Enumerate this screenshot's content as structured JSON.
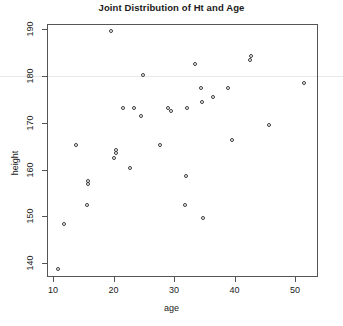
{
  "chart_data": {
    "type": "scatter",
    "title": "Joint Distribution of Ht and Age",
    "xlabel": "age",
    "ylabel": "height",
    "xlim": [
      9.0,
      53.8
    ],
    "ylim": [
      137.1,
      191.0
    ],
    "xticks": [
      10,
      20,
      30,
      40,
      50
    ],
    "xtick_labels": [
      "10",
      "20",
      "30",
      "40",
      "50"
    ],
    "yticks": [
      140,
      150,
      160,
      170,
      180,
      190
    ],
    "ytick_labels": [
      "140",
      "150",
      "160",
      "170",
      "180",
      "190"
    ],
    "grid": false,
    "legend": null,
    "marker": "open-circle",
    "marker_color": "#3a3a3a",
    "frame_color": "#555555",
    "guide_line_y": 180,
    "guide_line_color": "#e9e9e9",
    "n_points": 38,
    "series": [
      {
        "name": "observations",
        "x": [
          11.0,
          11.9,
          13.9,
          15.7,
          15.9,
          16.0,
          19.8,
          20.3,
          20.5,
          20.6,
          21.8,
          22.9,
          24.6,
          24.7,
          25.0,
          27.9,
          29.2,
          29.6,
          31.9,
          32.1,
          32.3,
          33.7,
          34.6,
          34.8,
          34.9,
          35.0,
          36.6,
          39.1,
          39.8,
          42.8,
          42.9,
          45.8,
          51.6
        ],
        "y": [
          138.5,
          148.2,
          165.0,
          152.2,
          156.6,
          157.4,
          189.3,
          162.2,
          163.3,
          164.0,
          172.9,
          160.2,
          172.9,
          180.0,
          171.2,
          165.1,
          172.9,
          172.2,
          152.2,
          158.4,
          172.9,
          182.2,
          177.2,
          174.1,
          149.5,
          174.1,
          175.2,
          177.2,
          166.1,
          183.2,
          184.0,
          169.3,
          178.2
        ]
      }
    ],
    "points": [
      {
        "age": 11.0,
        "height": 138.5
      },
      {
        "age": 11.9,
        "height": 148.2
      },
      {
        "age": 13.9,
        "height": 165.0
      },
      {
        "age": 15.7,
        "height": 152.2
      },
      {
        "age": 15.9,
        "height": 156.6
      },
      {
        "age": 16.0,
        "height": 157.4
      },
      {
        "age": 19.8,
        "height": 189.3
      },
      {
        "age": 20.3,
        "height": 162.2
      },
      {
        "age": 20.6,
        "height": 163.3
      },
      {
        "age": 20.6,
        "height": 164.0
      },
      {
        "age": 21.8,
        "height": 172.9
      },
      {
        "age": 22.9,
        "height": 160.2
      },
      {
        "age": 23.6,
        "height": 172.9
      },
      {
        "age": 24.7,
        "height": 171.2
      },
      {
        "age": 25.0,
        "height": 180.0
      },
      {
        "age": 27.9,
        "height": 165.1
      },
      {
        "age": 29.2,
        "height": 172.9
      },
      {
        "age": 29.6,
        "height": 172.2
      },
      {
        "age": 31.9,
        "height": 152.2
      },
      {
        "age": 32.1,
        "height": 158.4
      },
      {
        "age": 32.3,
        "height": 172.9
      },
      {
        "age": 33.7,
        "height": 182.2
      },
      {
        "age": 34.6,
        "height": 177.2
      },
      {
        "age": 34.8,
        "height": 174.1
      },
      {
        "age": 34.9,
        "height": 149.5
      },
      {
        "age": 36.6,
        "height": 175.2
      },
      {
        "age": 39.1,
        "height": 177.2
      },
      {
        "age": 39.8,
        "height": 166.1
      },
      {
        "age": 42.8,
        "height": 183.2
      },
      {
        "age": 42.9,
        "height": 184.0
      },
      {
        "age": 45.8,
        "height": 169.3
      },
      {
        "age": 51.6,
        "height": 178.2
      }
    ]
  }
}
